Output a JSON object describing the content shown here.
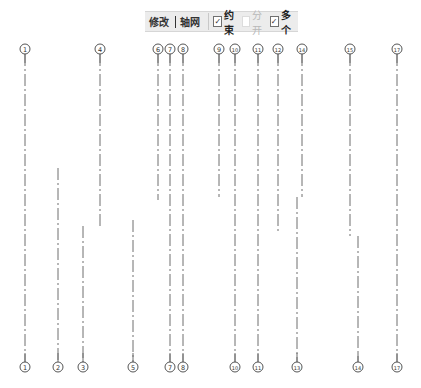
{
  "toolbar": {
    "tab_modify": "修改",
    "tab_grid": "轴网",
    "checkboxes": [
      {
        "label": "约束",
        "checked": true,
        "enabled": true
      },
      {
        "label": "分开",
        "checked": false,
        "enabled": false
      },
      {
        "label": "多个",
        "checked": true,
        "enabled": true
      }
    ]
  },
  "colors": {
    "line": "#6f6f6f",
    "bubble": "#555555",
    "toolbar_bg": "#ececec"
  },
  "grid": {
    "top_bubble_y": 49,
    "bottom_bubble_y": 367,
    "bubble_radius": 5,
    "lines": [
      {
        "id": "1",
        "x": 25,
        "y1": 54,
        "y2": 362,
        "top_label": "1",
        "bottom_label": "1"
      },
      {
        "id": "2",
        "x": 58,
        "y1": 168,
        "y2": 362,
        "top_label": null,
        "bottom_label": "2"
      },
      {
        "id": "3",
        "x": 83,
        "y1": 226,
        "y2": 362,
        "top_label": null,
        "bottom_label": "3"
      },
      {
        "id": "4",
        "x": 100,
        "y1": 54,
        "y2": 226,
        "top_label": "4",
        "bottom_label": null
      },
      {
        "id": "5",
        "x": 133,
        "y1": 220,
        "y2": 362,
        "top_label": null,
        "bottom_label": "5"
      },
      {
        "id": "6",
        "x": 158,
        "y1": 54,
        "y2": 200,
        "top_label": "6",
        "bottom_label": null
      },
      {
        "id": "7",
        "x": 170,
        "y1": 54,
        "y2": 362,
        "top_label": "7",
        "bottom_label": "7"
      },
      {
        "id": "8",
        "x": 183,
        "y1": 54,
        "y2": 362,
        "top_label": "8",
        "bottom_label": "8"
      },
      {
        "id": "9",
        "x": 219,
        "y1": 54,
        "y2": 197,
        "top_label": "9",
        "bottom_label": null
      },
      {
        "id": "10",
        "x": 235,
        "y1": 54,
        "y2": 362,
        "top_label": "10",
        "bottom_label": "10"
      },
      {
        "id": "11",
        "x": 258,
        "y1": 54,
        "y2": 362,
        "top_label": "11",
        "bottom_label": "11"
      },
      {
        "id": "12",
        "x": 278,
        "y1": 54,
        "y2": 232,
        "top_label": "12",
        "bottom_label": null
      },
      {
        "id": "13",
        "x": 297,
        "y1": 197,
        "y2": 362,
        "top_label": null,
        "bottom_label": "13"
      },
      {
        "id": "14a",
        "x": 302,
        "y1": 54,
        "y2": 197,
        "top_label": "14",
        "bottom_label": null
      },
      {
        "id": "15",
        "x": 350,
        "y1": 54,
        "y2": 236,
        "top_label": "15",
        "bottom_label": null
      },
      {
        "id": "14b",
        "x": 358,
        "y1": 236,
        "y2": 362,
        "top_label": null,
        "bottom_label": "14"
      },
      {
        "id": "17",
        "x": 397,
        "y1": 54,
        "y2": 362,
        "top_label": "17",
        "bottom_label": "17"
      }
    ]
  }
}
